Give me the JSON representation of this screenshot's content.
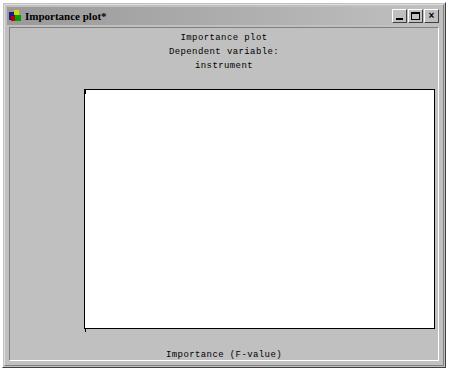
{
  "window": {
    "title": "Importance plot*",
    "icon": "app-icon",
    "buttons": [
      {
        "name": "minimize-button",
        "label": "_"
      },
      {
        "name": "maximize-button",
        "label": "□"
      },
      {
        "name": "close-button",
        "label": "×"
      }
    ]
  },
  "chart_data": {
    "type": "bar",
    "orientation": "horizontal",
    "title": "Importance plot",
    "subtitle": "Dependent variable:",
    "subtitle2": "instrument",
    "xlabel": "Importance (F-value)",
    "ylabel": "",
    "xlim": [
      0,
      25
    ],
    "xticks": [
      0,
      5,
      10,
      15,
      20,
      25
    ],
    "xticklabels": [
      "0",
      "5",
      "10",
      "15",
      "20",
      "25"
    ],
    "grid": true,
    "legend": false,
    "categories": [
      "meteorolog",
      "condit",
      "in-flight",
      "continu",
      "vfr",
      "land",
      "collis",
      "light",
      "ceil",
      "factor",
      "weather",
      "distanc",
      "execut",
      "adequ",
      "approach"
    ],
    "values": [
      22.7,
      10.0,
      10.0,
      7.9,
      7.9,
      5.8,
      5.6,
      5.2,
      5.1,
      5.0,
      4.9,
      4.9,
      4.8,
      4.8,
      4.7
    ]
  },
  "colors": {
    "window_face": "#c0c0c0",
    "plot_background": "#ffffff",
    "bar_fill": "#c8c8c8",
    "bar_edge": "#6e6e6e",
    "gridline": "#d4d4d4",
    "axis": "#000000"
  }
}
